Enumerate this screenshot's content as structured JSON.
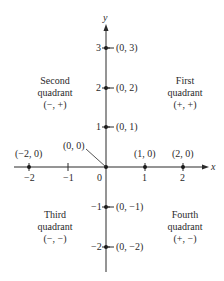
{
  "diagram": {
    "type": "cartesian-coordinate-plane",
    "colors": {
      "axis": "#2a2a2a",
      "text": "#2a2a2a",
      "background": "#ffffff"
    },
    "axes": {
      "x_label": "x",
      "y_label": "y",
      "x_ticks": [
        {
          "value": -2,
          "label": "−2"
        },
        {
          "value": -1,
          "label": "−1"
        },
        {
          "value": 0,
          "label": "0"
        },
        {
          "value": 1,
          "label": "1"
        },
        {
          "value": 2,
          "label": "2"
        }
      ],
      "y_ticks": [
        {
          "value": 3,
          "label": "3"
        },
        {
          "value": 2,
          "label": "2"
        },
        {
          "value": 1,
          "label": "1"
        },
        {
          "value": -1,
          "label": "−1"
        },
        {
          "value": -2,
          "label": "−2"
        }
      ]
    },
    "points": {
      "p03": "(0, 3)",
      "p02": "(0, 2)",
      "p01": "(0, 1)",
      "p0m1": "(0, −1)",
      "p0m2": "(0, −2)",
      "p00": "(0, 0)",
      "pm20": "(−2, 0)",
      "p10": "(1, 0)",
      "p20": "(2, 0)"
    },
    "quadrants": {
      "first": {
        "line1": "First",
        "line2": "quadrant",
        "signs": "(+, +)"
      },
      "second": {
        "line1": "Second",
        "line2": "quadrant",
        "signs": "(−, +)"
      },
      "third": {
        "line1": "Third",
        "line2": "quadrant",
        "signs": "(−, −)"
      },
      "fourth": {
        "line1": "Fourth",
        "line2": "quadrant",
        "signs": "(+, −)"
      }
    }
  }
}
